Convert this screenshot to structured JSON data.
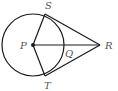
{
  "diagram": {
    "type": "geometry",
    "colors": {
      "stroke": "#1a1a1a",
      "label": "#555555",
      "background": "#ffffff"
    },
    "circle": {
      "center": "P",
      "cx": 33,
      "cy": 45,
      "r": 31
    },
    "points": {
      "P": {
        "label": "P",
        "x": 33,
        "y": 45
      },
      "S": {
        "label": "S",
        "x": 45,
        "y": 14
      },
      "T": {
        "label": "T",
        "x": 45,
        "y": 76
      },
      "R": {
        "label": "R",
        "x": 100,
        "y": 45
      },
      "Q": {
        "label": "Q",
        "x": 64,
        "y": 45
      }
    },
    "segments": [
      {
        "from": "P",
        "to": "S"
      },
      {
        "from": "P",
        "to": "T"
      },
      {
        "from": "P",
        "to": "R"
      },
      {
        "from": "S",
        "to": "R"
      },
      {
        "from": "T",
        "to": "R"
      }
    ]
  }
}
